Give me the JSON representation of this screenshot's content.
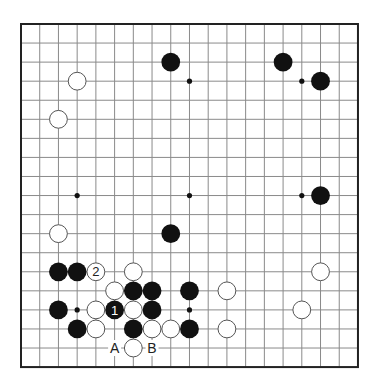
{
  "board": {
    "size": 19,
    "origin": {
      "x": 21,
      "y": 24
    },
    "spacing": {
      "x": 18.72,
      "y": 19.06
    },
    "colors": {
      "grid": "#8a8a8a",
      "border": "#222222",
      "black_stone": "#111111",
      "white_stone": "#ffffff",
      "white_outline": "#555555"
    },
    "star_points": [
      [
        3,
        3
      ],
      [
        9,
        3
      ],
      [
        15,
        3
      ],
      [
        3,
        9
      ],
      [
        9,
        9
      ],
      [
        15,
        9
      ],
      [
        3,
        15
      ],
      [
        9,
        15
      ],
      [
        15,
        15
      ]
    ],
    "stones": [
      {
        "color": "black",
        "col": 8,
        "row": 2
      },
      {
        "color": "black",
        "col": 14,
        "row": 2
      },
      {
        "color": "black",
        "col": 16,
        "row": 3
      },
      {
        "color": "black",
        "col": 16,
        "row": 9
      },
      {
        "color": "black",
        "col": 8,
        "row": 11
      },
      {
        "color": "black",
        "col": 2,
        "row": 13
      },
      {
        "color": "black",
        "col": 3,
        "row": 13
      },
      {
        "color": "black",
        "col": 6,
        "row": 14
      },
      {
        "color": "black",
        "col": 7,
        "row": 14
      },
      {
        "color": "black",
        "col": 9,
        "row": 14
      },
      {
        "color": "black",
        "col": 2,
        "row": 15
      },
      {
        "color": "black",
        "col": 5,
        "row": 15,
        "label": "1"
      },
      {
        "color": "black",
        "col": 7,
        "row": 15
      },
      {
        "color": "black",
        "col": 3,
        "row": 16
      },
      {
        "color": "black",
        "col": 6,
        "row": 16
      },
      {
        "color": "black",
        "col": 9,
        "row": 16
      },
      {
        "color": "white",
        "col": 3,
        "row": 3
      },
      {
        "color": "white",
        "col": 2,
        "row": 5
      },
      {
        "color": "white",
        "col": 2,
        "row": 11
      },
      {
        "color": "white",
        "col": 4,
        "row": 13,
        "label": "2"
      },
      {
        "color": "white",
        "col": 6,
        "row": 13
      },
      {
        "color": "white",
        "col": 16,
        "row": 13
      },
      {
        "color": "white",
        "col": 5,
        "row": 14
      },
      {
        "color": "white",
        "col": 11,
        "row": 14
      },
      {
        "color": "white",
        "col": 4,
        "row": 15
      },
      {
        "color": "white",
        "col": 6,
        "row": 15
      },
      {
        "color": "white",
        "col": 15,
        "row": 15
      },
      {
        "color": "white",
        "col": 4,
        "row": 16
      },
      {
        "color": "white",
        "col": 7,
        "row": 16
      },
      {
        "color": "white",
        "col": 8,
        "row": 16
      },
      {
        "color": "white",
        "col": 11,
        "row": 16
      },
      {
        "color": "white",
        "col": 6,
        "row": 17
      }
    ],
    "point_labels": [
      {
        "text": "A",
        "col": 5,
        "row": 17
      },
      {
        "text": "B",
        "col": 7,
        "row": 17
      }
    ]
  }
}
